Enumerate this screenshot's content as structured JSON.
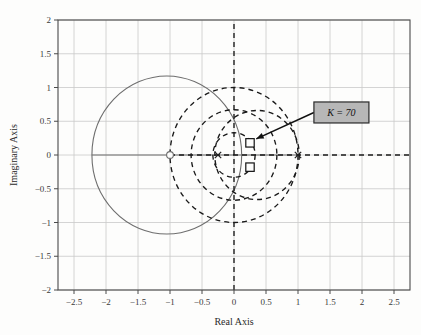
{
  "figure": {
    "xlabel": "Real Axis",
    "ylabel": "Imaginary Axis",
    "annotation_label": "K = 70",
    "colors": {
      "grid": "#c9c9c9",
      "frame": "#4a4a4a",
      "locus_solid": "#6e6e6e",
      "locus_dashed": "#1a1a1a",
      "annotation_box_fill": "#b7b7b7",
      "annotation_box_border": "#2a2a2a",
      "text": "#333333"
    }
  },
  "chart_data": {
    "type": "scatter",
    "title": "",
    "xlabel": "Real Axis",
    "ylabel": "Imaginary Axis",
    "xlim": [
      -2.75,
      2.75
    ],
    "ylim": [
      -2,
      2
    ],
    "xticks": [
      -2.5,
      -2,
      -1.5,
      -1,
      -0.5,
      0,
      0.5,
      1,
      1.5,
      2,
      2.5
    ],
    "xtick_labels": [
      "-2.5",
      "-2",
      "-1.5",
      "-1",
      "-0.5",
      "0",
      "0.5",
      "1",
      "1.5",
      "2",
      "2.5"
    ],
    "yticks": [
      -2,
      -1.5,
      -1,
      -0.5,
      0,
      0.5,
      1,
      1.5,
      2
    ],
    "ytick_labels": [
      "-2",
      "-1.5",
      "-1",
      "-0.5",
      "0",
      "0.5",
      "1",
      "1.5",
      "2"
    ],
    "grid": true,
    "legend": "none",
    "annotations": [
      {
        "text": "K = 70",
        "box_x": 1.28,
        "box_y": 0.63,
        "points_to_x": 0.27,
        "points_to_y": 0.18
      }
    ],
    "markers": {
      "zeros": [
        {
          "x": -1.0,
          "y": 0.0,
          "symbol": "o"
        }
      ],
      "poles": [
        {
          "x": -0.25,
          "y": 0.0,
          "symbol": "x"
        },
        {
          "x": 1.0,
          "y": 0.0,
          "symbol": "x"
        }
      ],
      "gain_points": [
        {
          "x": 0.25,
          "y": 0.18,
          "symbol": "square",
          "label": "K = 70"
        },
        {
          "x": 0.25,
          "y": -0.18,
          "symbol": "square",
          "label": "K = 70"
        }
      ]
    },
    "loci": [
      {
        "name": "solid-locus-circle",
        "style": "solid",
        "shape": "circle",
        "center_x": -1.05,
        "center_y": 0.0,
        "radius": 1.17
      },
      {
        "name": "real-axis-solid-segment",
        "style": "solid",
        "shape": "segment",
        "x_from": -2.22,
        "x_to": 1.0,
        "y": 0.0
      },
      {
        "name": "dashed-circle-outer",
        "style": "dashed",
        "shape": "circle",
        "center_x": 0.0,
        "center_y": 0.0,
        "radius": 1.0
      },
      {
        "name": "dashed-circle-middle",
        "style": "dashed",
        "shape": "circle",
        "center_x": 0.0,
        "center_y": 0.0,
        "radius": 0.67
      },
      {
        "name": "dashed-circle-inner",
        "style": "dashed",
        "shape": "circle",
        "center_x": 0.0,
        "center_y": 0.0,
        "radius": 0.33
      },
      {
        "name": "dashed-circle-offset",
        "style": "dashed",
        "shape": "circle",
        "center_x": 0.36,
        "center_y": 0.0,
        "radius": 0.66
      },
      {
        "name": "real-axis-dashed-segment",
        "style": "dashed",
        "shape": "segment",
        "x_from": -1.0,
        "x_to": 2.75,
        "y": 0.0
      },
      {
        "name": "imag-axis-dashed",
        "style": "dashed",
        "shape": "vline",
        "x": 0.0,
        "y_from": -2.0,
        "y_to": 2.0
      }
    ]
  }
}
